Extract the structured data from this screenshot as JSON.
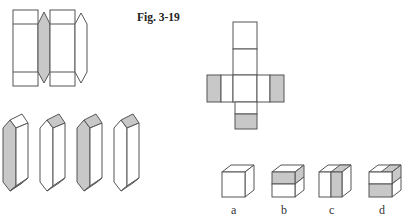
{
  "figure": {
    "caption": "Fig. 3-19",
    "colors": {
      "stroke": "#555555",
      "gray_fill": "#c8c8c8",
      "white_fill": "#ffffff"
    },
    "option_labels": [
      "a",
      "b",
      "c",
      "d"
    ]
  }
}
